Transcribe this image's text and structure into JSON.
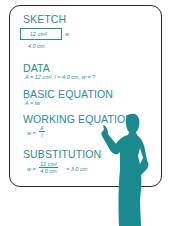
{
  "colors": {
    "accent": "#2a8d98",
    "silhouette": "#1a8a8f",
    "border": "#2b2b2b"
  },
  "sketch": {
    "heading": "SKETCH",
    "area": "12 cm²",
    "width_label": "w",
    "length_label": "4.0 cm"
  },
  "data": {
    "heading": "DATA",
    "text": "A = 12 cm², l = 4.0 cm, w = ?"
  },
  "basic_equation": {
    "heading": "BASIC EQUATION",
    "text": "A = lw"
  },
  "working_equation": {
    "heading": "WORKING EQUATION",
    "lhs": "w =",
    "numerator": "A",
    "denominator": "l"
  },
  "substitution": {
    "heading": "SUBSTITUTION",
    "lhs": "w =",
    "numerator": "12 cm²",
    "denominator": "4.0 cm",
    "result": "= 3.0 cm"
  },
  "figure": {
    "icon": "person-pointing-silhouette"
  }
}
